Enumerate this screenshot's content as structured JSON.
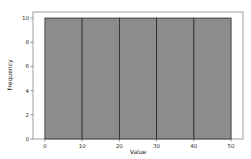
{
  "chart_data": {
    "type": "bar",
    "subtype": "histogram",
    "title": "",
    "xlabel": "Value",
    "ylabel": "Frequency",
    "bins": [
      {
        "start": 0,
        "end": 10,
        "count": 10
      },
      {
        "start": 10,
        "end": 20,
        "count": 10
      },
      {
        "start": 20,
        "end": 30,
        "count": 10
      },
      {
        "start": 30,
        "end": 40,
        "count": 10
      },
      {
        "start": 40,
        "end": 50,
        "count": 10
      }
    ],
    "categories": [
      "0-10",
      "10-20",
      "20-30",
      "30-40",
      "40-50"
    ],
    "values": [
      10,
      10,
      10,
      10,
      10
    ],
    "xticks": [
      0,
      10,
      20,
      30,
      40,
      50
    ],
    "yticks": [
      0,
      2,
      4,
      6,
      8,
      10
    ],
    "xlim": [
      -3.2,
      53.2
    ],
    "ylim": [
      0,
      10.5
    ],
    "grid": false,
    "legend": null,
    "colors": {
      "bar_fill": "#8c8c8c",
      "bar_edge": "#2b2b2b",
      "axis": "#555555",
      "background": "#ffffff"
    }
  }
}
